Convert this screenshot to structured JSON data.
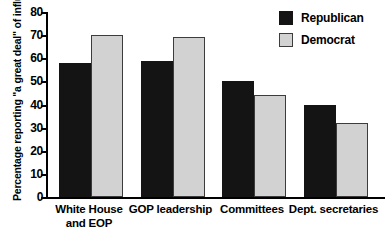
{
  "chart_data": {
    "type": "bar",
    "title": "",
    "xlabel": "",
    "ylabel": "Percentage reporting \"a great deal\" of influence",
    "ylim": [
      0,
      80
    ],
    "yticks": [
      0,
      10,
      20,
      30,
      40,
      50,
      60,
      70,
      80
    ],
    "grid": false,
    "legend_position": "top-right",
    "categories": [
      "White House and EOP",
      "GOP leadership",
      "Committees",
      "Dept. secretaries"
    ],
    "series": [
      {
        "name": "Republican",
        "color": "#141414",
        "values": [
          58,
          59,
          50,
          40
        ]
      },
      {
        "name": "Democrat",
        "color": "#d2d2d2",
        "values": [
          70,
          69,
          44,
          32
        ]
      }
    ]
  },
  "axis": {
    "y_title": "Percentage reporting \"a great deal\" of influence",
    "tick_labels": [
      "80",
      "70",
      "60",
      "50",
      "40",
      "30",
      "20",
      "10",
      "0"
    ]
  },
  "legend": {
    "items": [
      {
        "label": "Republican",
        "swatch": "dark-square-swatch"
      },
      {
        "label": "Democrat",
        "swatch": "light-square-swatch"
      }
    ]
  },
  "categories": [
    {
      "line1": "White House",
      "line2": "and EOP"
    },
    {
      "line1": "GOP leadership",
      "line2": ""
    },
    {
      "line1": "Committees",
      "line2": ""
    },
    {
      "line1": "Dept. secretaries",
      "line2": ""
    }
  ],
  "bottom_caption": ""
}
